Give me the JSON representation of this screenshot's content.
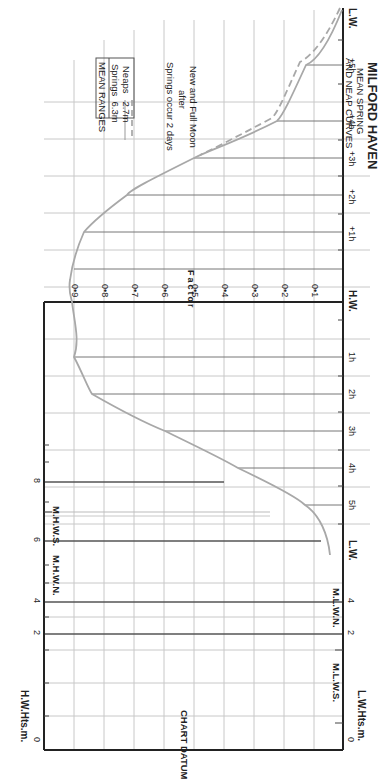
{
  "title": "MILFORD HAVEN",
  "subtitle_line1": "MEAN SPRING",
  "subtitle_line2": "AND NEAP CURVES",
  "mean_ranges": {
    "header": "MEAN RANGES",
    "springs_label": "Springs",
    "springs_value": "6.3m",
    "neaps_label": "Neaps",
    "neaps_value": "2.7m"
  },
  "note_line1": "Springs occur 2 days",
  "note_line2": "after",
  "note_line3": "New and Full Moon",
  "factor_label": "Factor",
  "factor_ticks": [
    "0•9",
    "0•8",
    "0•7",
    "0•6",
    "0•5",
    "0•4",
    "0•3",
    "0•2",
    "0•1"
  ],
  "time_axis": {
    "lw_top": "L.W.",
    "after_hw": [
      "+5h",
      "+4h",
      "+3h",
      "+2h",
      "+1h"
    ],
    "hw": "H.W.",
    "before_hw": [
      "1h",
      "2h",
      "3h",
      "4h",
      "5h"
    ],
    "lw_bottom": "L.W."
  },
  "height_scale": {
    "hw_axis_label": "H.W.Hts.m.",
    "lw_axis_label": "L.W.Hts.m.",
    "ticks": [
      "0",
      "2",
      "4",
      "6",
      "8"
    ],
    "lw_ticks": [
      "0",
      "2",
      "4"
    ],
    "mhws": "M.H.W.S.",
    "mhwn": "M.H.W.N.",
    "mlwn": "M.L.W.N.",
    "mlws": "M.L.W.S.",
    "chart_datum": "CHART DATUM"
  },
  "colors": {
    "curve": "#a8a8a8",
    "grid": "#c4c4c4",
    "frame": "#222222"
  }
}
